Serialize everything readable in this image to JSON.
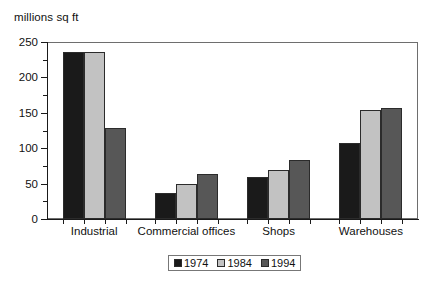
{
  "chart_data": {
    "type": "bar",
    "title": "",
    "subtitle": "",
    "xlabel": "",
    "ylabel": "millions sq ft",
    "ylim": [
      0,
      250
    ],
    "ytick_values": [
      0,
      50,
      100,
      150,
      200,
      250
    ],
    "ytick_labels": [
      "0",
      "50",
      "100",
      "150",
      "200",
      "250"
    ],
    "yminor_values": [
      25,
      75,
      125,
      175,
      225
    ],
    "grid": false,
    "legend_position": "bottom-center",
    "categories": [
      "Industrial",
      "Commercial offices",
      "Shops",
      "Warehouses"
    ],
    "series": [
      {
        "name": "1974",
        "color": "#1a1a1a",
        "values": [
          236,
          37,
          59,
          107
        ]
      },
      {
        "name": "1984",
        "color": "#c2c2c2",
        "values": [
          236,
          49,
          69,
          154
        ]
      },
      {
        "name": "1994",
        "color": "#575757",
        "values": [
          128,
          63,
          84,
          157
        ]
      }
    ]
  },
  "legend": {
    "items": [
      {
        "label": "1974",
        "color": "#1a1a1a"
      },
      {
        "label": "1984",
        "color": "#c2c2c2"
      },
      {
        "label": "1994",
        "color": "#575757"
      }
    ]
  },
  "axis": {
    "y_title": "millions sq ft"
  }
}
